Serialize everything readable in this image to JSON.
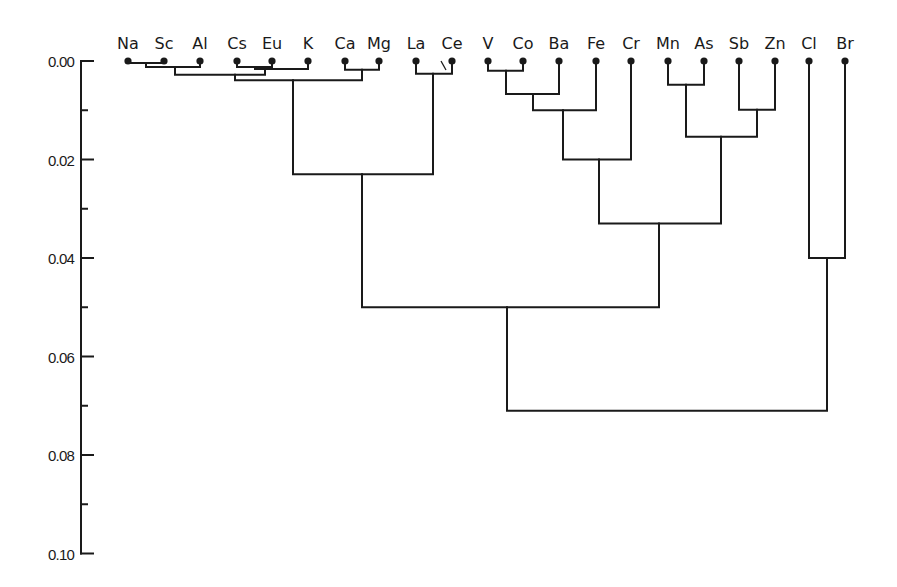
{
  "chart_data": {
    "type": "dendrogram",
    "title": "",
    "xlabel": "",
    "ylabel": "",
    "ylim": [
      0.0,
      0.1
    ],
    "y_inverted": true,
    "y_ticks": [
      "0.00",
      "0.02",
      "0.04",
      "0.06",
      "0.08",
      "0.10"
    ],
    "y_tick_values": [
      0.0,
      0.02,
      0.04,
      0.06,
      0.08,
      0.1
    ],
    "y_minor_ticks": [
      0.01,
      0.03,
      0.05,
      0.07,
      0.09
    ],
    "grid": false,
    "legend": null,
    "leaves": [
      "Na",
      "Sc",
      "Al",
      "Cs",
      "Eu",
      "K",
      "Ca",
      "Mg",
      "La",
      "Ce",
      "V",
      "Co",
      "Ba",
      "Fe",
      "Cr",
      "Mn",
      "As",
      "Sb",
      "Zn",
      "Cl",
      "Br"
    ],
    "merges": [
      {
        "id": "m1",
        "left": "Na",
        "right": "Sc",
        "height": 0.0004
      },
      {
        "id": "m2",
        "left": "m1",
        "right": "Al",
        "height": 0.0012
      },
      {
        "id": "m3",
        "left": "Cs",
        "right": "Eu",
        "height": 0.0012
      },
      {
        "id": "m4",
        "left": "m3",
        "right": "K",
        "height": 0.0016
      },
      {
        "id": "m5",
        "left": "m2",
        "right": "m4",
        "height": 0.0028
      },
      {
        "id": "m6",
        "left": "Ca",
        "right": "Mg",
        "height": 0.0018
      },
      {
        "id": "m7",
        "left": "m5",
        "right": "m6",
        "height": 0.0039
      },
      {
        "id": "m8",
        "left": "La",
        "right": "Ce",
        "height": 0.0026
      },
      {
        "id": "m9",
        "left": "m7",
        "right": "m8",
        "height": 0.023
      },
      {
        "id": "m10",
        "left": "V",
        "right": "Co",
        "height": 0.002
      },
      {
        "id": "m11",
        "left": "m10",
        "right": "Ba",
        "height": 0.0067
      },
      {
        "id": "m12",
        "left": "m11",
        "right": "Fe",
        "height": 0.01
      },
      {
        "id": "m13",
        "left": "m12",
        "right": "Cr",
        "height": 0.02
      },
      {
        "id": "m14",
        "left": "Mn",
        "right": "As",
        "height": 0.0048
      },
      {
        "id": "m15",
        "left": "Sb",
        "right": "Zn",
        "height": 0.0099
      },
      {
        "id": "m16",
        "left": "m14",
        "right": "m15",
        "height": 0.0154
      },
      {
        "id": "m17",
        "left": "m13",
        "right": "m16",
        "height": 0.033
      },
      {
        "id": "m18",
        "left": "m9",
        "right": "m17",
        "height": 0.05
      },
      {
        "id": "m19",
        "left": "Cl",
        "right": "Br",
        "height": 0.04
      },
      {
        "id": "m20",
        "left": "m18",
        "right": "m19",
        "height": 0.071
      }
    ]
  },
  "layout": {
    "leaf_x": {
      "Na": 128,
      "Sc": 164,
      "Al": 200,
      "Cs": 237,
      "Eu": 272,
      "K": 308,
      "Ca": 345,
      "Mg": 379,
      "La": 416,
      "Ce": 452,
      "V": 488,
      "Co": 523,
      "Ba": 559,
      "Fe": 596,
      "Cr": 631,
      "Mn": 668,
      "As": 704,
      "Sb": 739,
      "Zn": 775,
      "Cl": 809,
      "Br": 845
    },
    "merge_x": {
      "m1": 146,
      "m2": 175,
      "m3": 255,
      "m4": 265,
      "m5": 235,
      "m6": 362,
      "m7": 293,
      "m8": 433,
      "m9": 362,
      "m10": 506,
      "m11": 533,
      "m12": 563,
      "m13": 599,
      "m14": 686,
      "m15": 757,
      "m16": 721,
      "m17": 659,
      "m18": 507,
      "m19": 827,
      "m20": 827
    },
    "axis_x": 81,
    "y_zero_px": 61,
    "px_per_unit": 4925,
    "line_color": "#1a1a1a",
    "background": "#ffffff"
  }
}
